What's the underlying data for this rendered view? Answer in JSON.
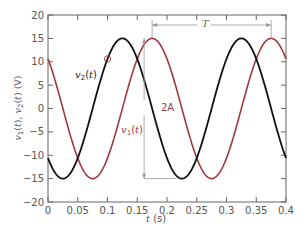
{
  "chart_data": {
    "type": "line",
    "title": "",
    "xlabel": "t (s)",
    "ylabel": "v1(t), v2(t) (V)",
    "xlim": [
      0,
      0.4
    ],
    "ylim": [
      -20,
      20
    ],
    "xticks": [
      0,
      0.05,
      0.1,
      0.15,
      0.2,
      0.25,
      0.3,
      0.35,
      0.4
    ],
    "xtick_labels": [
      "0",
      "0.05",
      "0.1",
      "0.15",
      "0.2",
      "0.25",
      "0.3",
      "0.35",
      "0.4"
    ],
    "yticks": [
      20,
      15,
      10,
      5,
      0,
      -5,
      -10,
      -15,
      -20
    ],
    "ytick_labels": [
      "20",
      "15",
      "10",
      "5",
      "0",
      "-5",
      "-10",
      "-15",
      "-20"
    ],
    "grid": false,
    "series": [
      {
        "name": "v1(t)",
        "color": "#a0393f",
        "amplitude": 15,
        "period": 0.2,
        "peak_time": 0.175,
        "value_at_0": 10.6
      },
      {
        "name": "v2(t)",
        "color": "#111111",
        "amplitude": 15,
        "period": 0.2,
        "peak_time": 0.125,
        "value_at_0": -10.6
      }
    ],
    "annotations": [
      {
        "label": "T",
        "type": "dimension",
        "from_t": 0.175,
        "to_t": 0.375,
        "description": "period between peaks of v1"
      },
      {
        "label": "2A",
        "type": "dimension",
        "from_v": 15,
        "to_v": -15,
        "at_t": 0.175,
        "description": "peak-to-peak amplitude"
      },
      {
        "label": "circle",
        "type": "marker",
        "at_t": 0.1,
        "value": 10.6,
        "description": "intersection marker"
      }
    ]
  },
  "labels": {
    "xlabel": "t (s)",
    "v1": "v1(t)",
    "v2": "v2(t)",
    "T": "T",
    "twoA": "2A"
  },
  "colors": {
    "v1": "#a0393f",
    "v2": "#111111",
    "axis": "#666666",
    "annotation": "#999999"
  }
}
